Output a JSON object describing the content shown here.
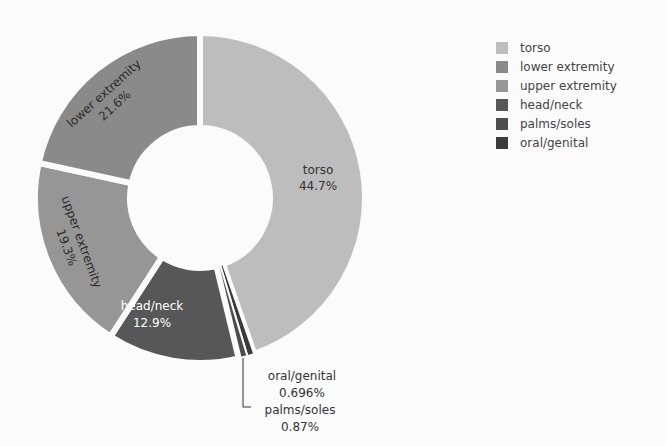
{
  "chart_data": {
    "type": "pie",
    "subtype": "donut",
    "title": "",
    "center": [
      200,
      198
    ],
    "outer_radius": 165,
    "inner_radius": 70,
    "start_angle_deg": 0,
    "direction": "clockwise",
    "categories": [
      "torso",
      "oral/genital",
      "palms/soles",
      "head/neck",
      "upper extremity",
      "lower extremity"
    ],
    "values": [
      44.7,
      0.696,
      0.87,
      12.9,
      19.3,
      21.6
    ],
    "labels_text": [
      "44.7%",
      "0.696%",
      "0.87%",
      "12.9%",
      "19.3%",
      "21.6%"
    ],
    "colors": [
      "#bdbdbd",
      "#3b3b3b",
      "#4d4d4d",
      "#575757",
      "#969696",
      "#8a8a8a"
    ],
    "legend_position": "right",
    "legend": [
      {
        "label": "torso",
        "color": "#bdbdbd"
      },
      {
        "label": "lower extremity",
        "color": "#8a8a8a"
      },
      {
        "label": "upper extremity",
        "color": "#969696"
      },
      {
        "label": "head/neck",
        "color": "#575757"
      },
      {
        "label": "palms/soles",
        "color": "#4d4d4d"
      },
      {
        "label": "oral/genital",
        "color": "#3b3b3b"
      }
    ]
  },
  "slice_labels": {
    "torso": {
      "name": "torso",
      "pct": "44.7%"
    },
    "lower": {
      "name": "lower extremity",
      "pct": "21.6%"
    },
    "upper": {
      "name": "upper extremity",
      "pct": "19.3%"
    },
    "head": {
      "name": "head/neck",
      "pct": "12.9%"
    },
    "oral": {
      "name": "oral/genital",
      "pct": "0.696%"
    },
    "palms": {
      "name": "palms/soles",
      "pct": "0.87%"
    }
  }
}
